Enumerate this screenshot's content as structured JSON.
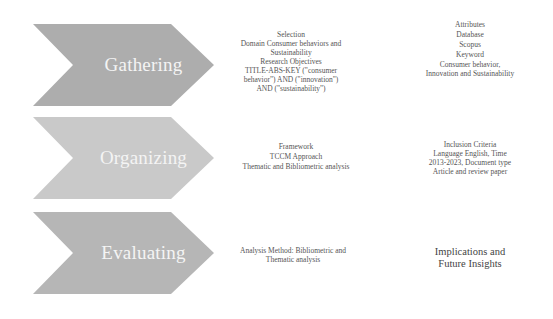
{
  "stages": [
    {
      "label": "Gathering",
      "fill": "#adadad",
      "middle": [
        "Selection",
        "Domain Consumer behaviors and Sustainability",
        "Research Objectives",
        "TITLE-ABS-KEY (\"consumer behavior\") AND (\"innovation\") AND (\"sustainability\")"
      ],
      "right": [
        "Attributes",
        "Database",
        "Scopus",
        "Keyword",
        "Consumer behavior, Innovation and Sustainability"
      ]
    },
    {
      "label": "Organizing",
      "fill": "#c9c9c9",
      "middle": [
        "Framework",
        "TCCM Approach",
        "Thematic and Bibliometric analysis"
      ],
      "right": [
        "Inclusion Criteria",
        "Language English, Time 2013-2023, Document type Article and review paper"
      ]
    },
    {
      "label": "Evaluating",
      "fill": "#b6b6b6",
      "middle": [
        "Analysis Method: Bibliometric and Thematic analysis"
      ],
      "right": [
        "Implications and Future Insights"
      ]
    }
  ]
}
